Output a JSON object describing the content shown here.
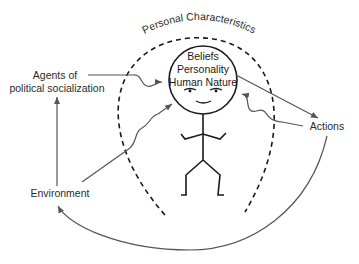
{
  "diagram": {
    "title_arc": "Personal Characteristics",
    "head_lines": [
      "Beliefs",
      "Personality",
      "Human Nature"
    ],
    "nodes": {
      "agents": [
        "Agents of",
        "political socialization"
      ],
      "environment": "Environment",
      "actions": "Actions"
    },
    "edges": [
      {
        "from": "agents",
        "to": "head",
        "style": "wavy-arrow"
      },
      {
        "from": "environment",
        "to": "head",
        "style": "wavy-arrow"
      },
      {
        "from": "environment",
        "to": "agents",
        "style": "arrow"
      },
      {
        "from": "head",
        "to": "actions",
        "style": "arrow"
      },
      {
        "from": "actions",
        "to": "head",
        "style": "wavy-arrow"
      },
      {
        "from": "actions",
        "to": "environment",
        "style": "curved-arrow"
      }
    ],
    "colors": {
      "ink": "#1a1a1a",
      "arrow": "#555555"
    }
  }
}
